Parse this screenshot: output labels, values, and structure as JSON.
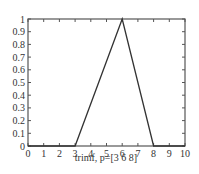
{
  "chart_data": {
    "type": "line",
    "title": "",
    "xlabel": "trimf, p=[3 6 8]",
    "ylabel": "",
    "xlim": [
      0,
      10
    ],
    "ylim": [
      0,
      1
    ],
    "grid": false,
    "x_ticks": [
      "0",
      "1",
      "2",
      "3",
      "4",
      "5",
      "6",
      "7",
      "8",
      "9",
      "10"
    ],
    "y_ticks": [
      "0",
      "0.1",
      "0.2",
      "0.3",
      "0.4",
      "0.5",
      "0.6",
      "0.7",
      "0.8",
      "0.9",
      "1"
    ],
    "series": [
      {
        "name": "trimf",
        "x": [
          0,
          3,
          6,
          8,
          10
        ],
        "y": [
          0,
          0,
          1,
          0,
          0
        ],
        "color": "#333333"
      }
    ]
  },
  "colors": {
    "axis": "#555555",
    "line": "#333333",
    "background": "#ffffff"
  }
}
